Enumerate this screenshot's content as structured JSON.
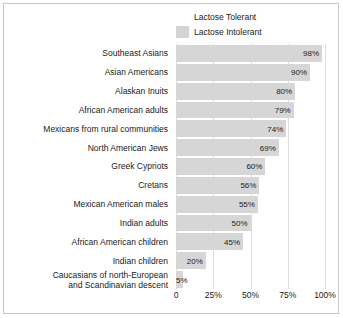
{
  "chart_data": {
    "type": "bar",
    "orientation": "horizontal",
    "title": "",
    "xlabel": "",
    "ylabel": "",
    "xlim": [
      0,
      100
    ],
    "grid": true,
    "legend_position": "top-center",
    "legend": [
      {
        "label": "Lactose Tolerant",
        "color": "#ffffff",
        "swatch": "tolerant"
      },
      {
        "label": "Lactose Intolerant",
        "color": "#d4d4d4",
        "swatch": "intolerant"
      }
    ],
    "categories": [
      "Southeast Asians",
      "Asian Americans",
      "Alaskan Inuits",
      "African American adults",
      "Mexicans from rural communities",
      "North American Jews",
      "Greek Cypriots",
      "Cretans",
      "Mexican American males",
      "Indian adults",
      "African American children",
      "Indian children",
      "Caucasians of north-European\nand Scandinavian descent"
    ],
    "values": [
      98,
      90,
      80,
      79,
      74,
      69,
      60,
      56,
      55,
      50,
      45,
      20,
      5
    ],
    "value_labels": [
      "98%",
      "90%",
      "80%",
      "79%",
      "74%",
      "69%",
      "60%",
      "56%",
      "55%",
      "50%",
      "45%",
      "20%",
      "5%"
    ],
    "xticks": [
      0,
      25,
      50,
      75,
      100
    ],
    "xtick_labels": [
      "0",
      "25%",
      "50%",
      "75%",
      "100%"
    ],
    "series_name": "Lactose Intolerant",
    "bar_color": "#d6d6d6",
    "gridline_color": "#dcdcdc",
    "frame_color": "#c8c8c8",
    "background": "#ffffff"
  }
}
